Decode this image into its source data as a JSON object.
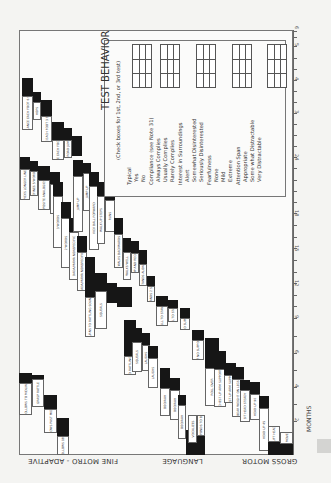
{
  "sections": {
    "fine_motor": "FINE MOTRO - ADAPTIVE",
    "language": "LANGUAGE",
    "gross_motor": "GROSS MOTOR"
  },
  "axis": {
    "label": "MONTHS",
    "ticks": [
      "2",
      "4",
      "6",
      "9",
      "12",
      "15",
      "18",
      "24",
      "3",
      "4",
      "5",
      "6"
    ]
  },
  "test_behavior": {
    "title": "TEST BEHAVIOR",
    "subtitle": "(Check boxes for 1st, 2nd, or 3rd test)",
    "items": [
      {
        "text": "Typical",
        "indent": 0
      },
      {
        "text": "Yes",
        "indent": 1
      },
      {
        "text": "No",
        "indent": 1
      },
      {
        "text": "Compliance (see Note 31)",
        "indent": 0
      },
      {
        "text": "Always Complies",
        "indent": 1
      },
      {
        "text": "Usually Complies",
        "indent": 1
      },
      {
        "text": "Rarely Complies",
        "indent": 1
      },
      {
        "text": "Interest in Surroundings",
        "indent": 0
      },
      {
        "text": "Alert",
        "indent": 1
      },
      {
        "text": "Somewhat Disinterested",
        "indent": 1
      },
      {
        "text": "Seriously Disinterested",
        "indent": 1
      },
      {
        "text": "Fearfulness",
        "indent": 0
      },
      {
        "text": "None",
        "indent": 1
      },
      {
        "text": "Mild",
        "indent": 1
      },
      {
        "text": "Extreme",
        "indent": 1
      },
      {
        "text": "Attention Span",
        "indent": 0
      },
      {
        "text": "Appropriate",
        "indent": 1
      },
      {
        "text": "Some what Distractable",
        "indent": 1
      },
      {
        "text": "Very Distractable",
        "indent": 1
      }
    ]
  },
  "chart_items": {
    "fine_motor": [
      "BALANCE EACH FOOT 6 SEC",
      "HOPS",
      "BALANCE EACH FOOT 3 SECONDS",
      "BALANCE EACH FOOT 2 SEC",
      "BROAD JUMP",
      "FOLLOWS TO MIDLINE",
      "GRASP RATTLE",
      "FOLLOWS PAST MIDLINE",
      "FOLLOWS 180"
    ],
    "language": [
      "PICKS LONGER LINE",
      "DEFINES 5 WORDS",
      "OPPOSITE ANALOGIES 2",
      "DEFINES 7 WORDS",
      "3 WORDS",
      "2 WORDS",
      "DADA/MAMA NONSPECIFIC",
      "TURNS TO RATTLING SOUND",
      "SQUEALS",
      "LAUGHS",
      "OOO/AAH",
      "VOCALIZES",
      "RESPONDS TO BELL"
    ],
    "gross_motor": [
      "JUMP UP",
      "KICK BALL FORWARD",
      "WALK UP STEPS",
      "RUNS",
      "WALKS BACKWARDS",
      "WALKS WELL",
      "STOOP AND RECOVER",
      "STANDS ALONE",
      "STANDS 2 SEC",
      "PULL TO STAND",
      "SIT NO SUPPORT",
      "ROLL OVER",
      "CHEST UP ARM SUPPORT",
      "BEAR WEIGHT ON LEGS",
      "SIT HEAD STEADY",
      "HEAD UP 90",
      "HEAD UP 45",
      "LIFT HEAD",
      "EQUAL MOVEMENTS"
    ]
  }
}
